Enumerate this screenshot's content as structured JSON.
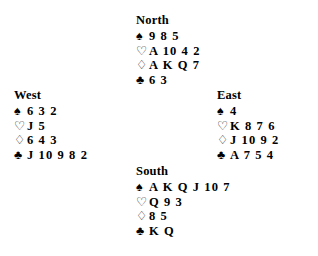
{
  "document": {
    "type": "bridge-hand-diagram",
    "background_color": "#ffffff",
    "text_color": "#000000"
  },
  "suit_symbols": {
    "spade": "♠",
    "heart": "♡",
    "diamond": "♢",
    "club": "♣"
  },
  "hands": {
    "north": {
      "label": "North",
      "spades": "9 8 5",
      "hearts": "A 10 4 2",
      "diamonds": "A K Q 7",
      "clubs": "6 3"
    },
    "west": {
      "label": "West",
      "spades": "6 3 2",
      "hearts": "J 5",
      "diamonds": "6 4 3",
      "clubs": "J 10 9 8 2"
    },
    "east": {
      "label": "East",
      "spades": "4",
      "hearts": "K 8 7 6",
      "diamonds": "J 10 9 2",
      "clubs": "A 7 5 4"
    },
    "south": {
      "label": "South",
      "spades": "A K Q J 10 7",
      "hearts": "Q 9 3",
      "diamonds": "8 5",
      "clubs": "K Q"
    }
  }
}
